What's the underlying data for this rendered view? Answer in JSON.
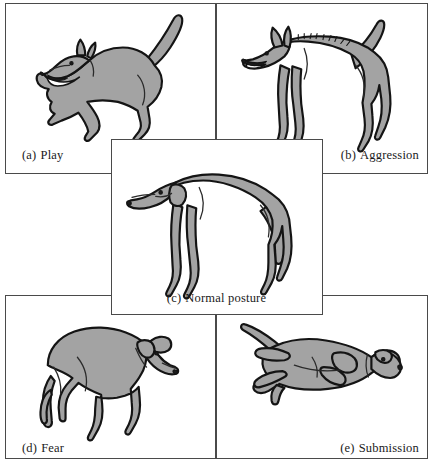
{
  "figure": {
    "background_color": "#ffffff",
    "panel_border_color": "#4a4a4a",
    "dog_fill_color": "#a3a3a3",
    "dog_outline_color": "#141414",
    "panels": [
      {
        "id": "a",
        "tag": "(a)",
        "label": "Play",
        "caption": "(a) Play",
        "caption_align": "left",
        "illustration": "dog-play-bow-front-lowered-tail-raised-mouth-open"
      },
      {
        "id": "b",
        "tag": "(b)",
        "label": "Aggression",
        "caption": "(b) Aggression",
        "caption_align": "right",
        "illustration": "dog-aggression-erect-stance-raised-hackles-bared-teeth-ears-forward-tail-up"
      },
      {
        "id": "c",
        "tag": "(c)",
        "label": "Normal posture",
        "caption": "(c) Normal posture",
        "caption_align": "center",
        "illustration": "dog-normal-standing-relaxed-ears-down-tail-hanging"
      },
      {
        "id": "d",
        "tag": "(d)",
        "label": "Fear",
        "caption": "(d) Fear",
        "caption_align": "left",
        "illustration": "dog-fear-crouched-arched-back-tail-tucked-head-lowered-ears-back"
      },
      {
        "id": "e",
        "tag": "(e)",
        "label": "Submission",
        "caption": "(e) Submission",
        "caption_align": "right",
        "illustration": "dog-submission-lying-on-back-legs-up-head-turned-away"
      }
    ]
  }
}
